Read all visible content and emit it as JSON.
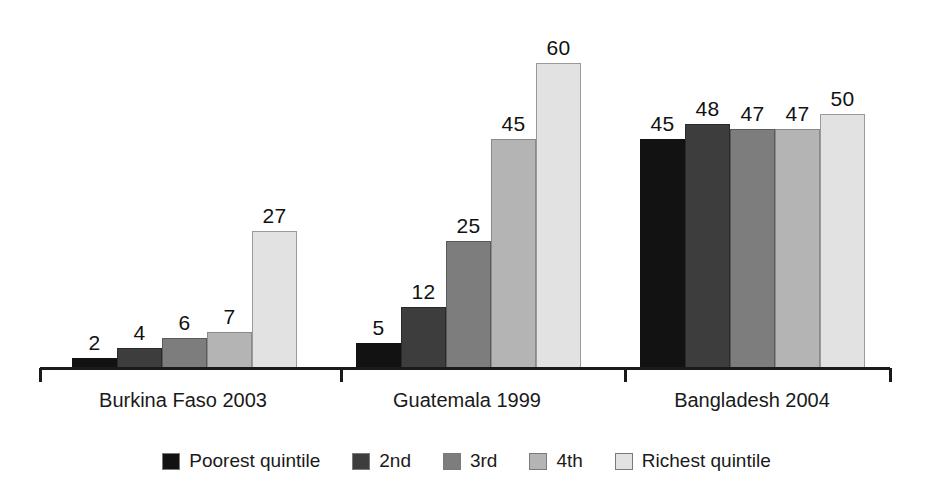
{
  "chart_data": {
    "type": "bar",
    "title": "",
    "subtitle": "",
    "xlabel": "",
    "ylabel": "",
    "grid": false,
    "legend_position": "bottom",
    "ylim": [
      0,
      65
    ],
    "axis_visible": "x-only",
    "categories": [
      "Burkina Faso 2003",
      "Guatemala 1999",
      "Bangladesh 2004"
    ],
    "series": [
      {
        "name": "Poorest quintile",
        "color": "#121212",
        "values": [
          2,
          5,
          45
        ]
      },
      {
        "name": "2nd",
        "color": "#3d3d3d",
        "values": [
          4,
          12,
          48
        ]
      },
      {
        "name": "3rd",
        "color": "#7d7d7d",
        "values": [
          6,
          25,
          47
        ]
      },
      {
        "name": "4th",
        "color": "#b4b4b4",
        "values": [
          7,
          45,
          47
        ]
      },
      {
        "name": "Richest quintile",
        "color": "#e2e2e2",
        "values": [
          27,
          60,
          50
        ]
      }
    ],
    "data_labels": [
      [
        "2",
        "4",
        "6",
        "7",
        "27"
      ],
      [
        "5",
        "12",
        "25",
        "45",
        "60"
      ],
      [
        "45",
        "48",
        "47",
        "47",
        "50"
      ]
    ]
  },
  "layout": {
    "group_left_px": [
      72,
      356,
      640
    ],
    "bar_width_px": 45,
    "baseline_y_px": 368,
    "px_per_unit": 5.08,
    "axis_left_px": 40,
    "axis_right_px": 890,
    "tick_x_px": [
      40,
      341,
      625,
      890
    ],
    "cat_label_center_px": [
      183,
      467,
      752
    ]
  }
}
